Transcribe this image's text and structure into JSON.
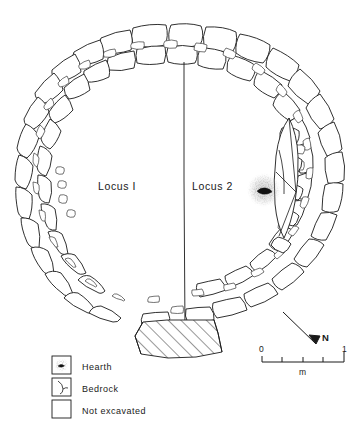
{
  "figure": {
    "type": "archaeological-site-plan",
    "background_color": "#ffffff",
    "ink_color": "#1a1a1a"
  },
  "plan": {
    "loci": [
      {
        "id": "locus-1",
        "label": "Locus I",
        "x": 128,
        "y": 186
      },
      {
        "id": "locus-2",
        "label": "Locus 2",
        "x": 222,
        "y": 186
      }
    ],
    "features": [
      {
        "id": "hearth",
        "type": "hearth",
        "cx": 264,
        "cy": 190
      },
      {
        "id": "bedrock",
        "type": "bedrock",
        "cx": 297,
        "cy": 190
      },
      {
        "id": "not-excavated",
        "type": "not-excavated",
        "cx": 185,
        "cy": 330
      }
    ],
    "ring": {
      "center_x": 183,
      "center_y": 182,
      "outer_radius": 160,
      "inner_radius": 118
    }
  },
  "scale": {
    "start_label": "0",
    "end_label": "1",
    "unit_label": "m",
    "segments": 4
  },
  "north": {
    "label": "N"
  },
  "legend": {
    "items": [
      {
        "key": "hearth",
        "label": "Hearth",
        "symbol": "hearth-symbol"
      },
      {
        "key": "bedrock",
        "label": "Bedrock",
        "symbol": "bedrock-symbol"
      },
      {
        "key": "not_excavated",
        "label": "Not excavated",
        "symbol": "hatch-symbol"
      }
    ]
  }
}
